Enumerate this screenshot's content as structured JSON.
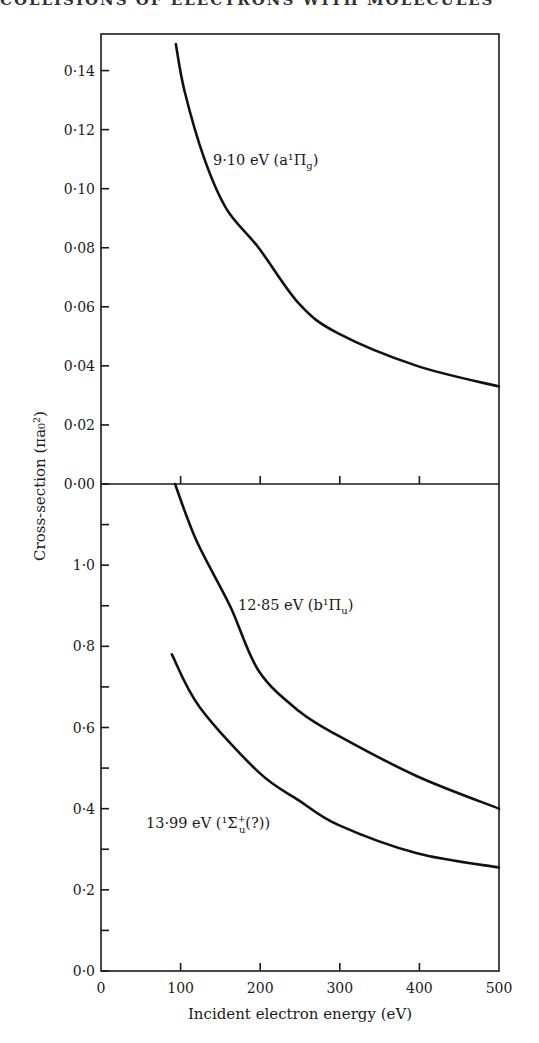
{
  "page": {
    "running_header": "COLLISIONS OF ELECTRONS WITH MOLECULES"
  },
  "chart_data": [
    {
      "type": "line",
      "panel": "upper",
      "title": "",
      "xlabel": "Incident electron energy (eV)",
      "ylabel": "Cross-section (πa₀²)",
      "xlim": [
        0,
        500
      ],
      "ylim": [
        0.0,
        0.15
      ],
      "x_ticks": [
        0,
        100,
        200,
        300,
        400,
        500
      ],
      "y_ticks": [
        0.0,
        0.02,
        0.04,
        0.06,
        0.08,
        0.1,
        0.12,
        0.14
      ],
      "y_tick_labels": [
        "0·00",
        "0·02",
        "0·04",
        "0·06",
        "0·08",
        "0·10",
        "0·12",
        "0·14"
      ],
      "grid": false,
      "series": [
        {
          "name": "9·10 eV (a¹Πg)",
          "label": "9·10 eV (a¹Π",
          "label_sub": "g",
          "label_tail": ")",
          "x": [
            94,
            105,
            130,
            158,
            198,
            249,
            298,
            397,
            500
          ],
          "y": [
            0.149,
            0.133,
            0.11,
            0.093,
            0.08,
            0.061,
            0.051,
            0.04,
            0.033
          ]
        }
      ]
    },
    {
      "type": "line",
      "panel": "lower",
      "title": "",
      "xlabel": "Incident electron energy (eV)",
      "ylabel": "Cross-section (πa₀²)",
      "xlim": [
        0,
        500
      ],
      "ylim": [
        0.0,
        1.2
      ],
      "x_ticks": [
        0,
        100,
        200,
        300,
        400,
        500
      ],
      "x_tick_labels": [
        "0",
        "100",
        "200",
        "300",
        "400",
        "500"
      ],
      "y_ticks": [
        0.0,
        0.1,
        0.2,
        0.3,
        0.4,
        0.5,
        0.6,
        0.7,
        0.8,
        0.9,
        1.0,
        1.1
      ],
      "y_tick_labels": [
        "0·0",
        "",
        "0·2",
        "",
        "0·4",
        "",
        "0·6",
        "",
        "0·8",
        "",
        "1·0",
        ""
      ],
      "grid": false,
      "series": [
        {
          "name": "12·85 eV (b¹Πu)",
          "label": "12·85 eV (b¹Π",
          "label_sub": "u",
          "label_tail": ")",
          "x": [
            93,
            120,
            162,
            198,
            249,
            298,
            397,
            500
          ],
          "y": [
            1.2,
            1.06,
            0.9,
            0.74,
            0.64,
            0.58,
            0.48,
            0.4
          ]
        },
        {
          "name": "13·99 eV (¹Σu⁺(?))",
          "label": "13·99 eV (¹Σ",
          "label_sub": "u",
          "label_sup": "+",
          "label_tail": "(?))",
          "x": [
            89,
            124,
            198,
            249,
            298,
            397,
            500
          ],
          "y": [
            0.78,
            0.65,
            0.49,
            0.42,
            0.36,
            0.29,
            0.255
          ]
        }
      ]
    }
  ]
}
